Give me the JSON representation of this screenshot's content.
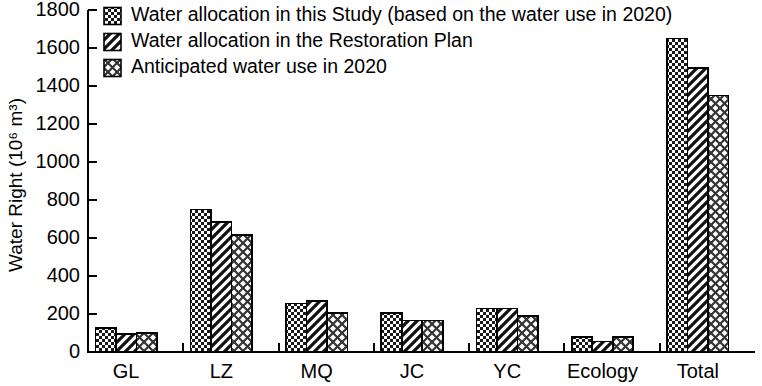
{
  "chart_data": {
    "type": "bar",
    "title": "",
    "xlabel": "",
    "ylabel": "Water Right (10⁶ m³)",
    "ylim": [
      0,
      1800
    ],
    "ytick_labels": [
      "0",
      "200",
      "400",
      "600",
      "800",
      "1000",
      "1200",
      "1400",
      "1600",
      "1800"
    ],
    "ytick_values": [
      0,
      200,
      400,
      600,
      800,
      1000,
      1200,
      1400,
      1600,
      1800
    ],
    "grid": false,
    "legend_position": "top-left",
    "categories": [
      "GL",
      "LZ",
      "MQ",
      "JC",
      "YC",
      "Ecology",
      "Total"
    ],
    "series": [
      {
        "name": "Water allocation in this Study (based on the water use in 2020)",
        "pattern": "dark-checker",
        "values": [
          125,
          750,
          255,
          205,
          228,
          80,
          1650
        ]
      },
      {
        "name": "Water allocation in the Restoration Plan",
        "pattern": "diagonal-hatch",
        "values": [
          95,
          685,
          268,
          165,
          228,
          55,
          1495
        ]
      },
      {
        "name": "Anticipated water use in 2020",
        "pattern": "cross-hatch",
        "values": [
          100,
          615,
          205,
          165,
          190,
          80,
          1350
        ]
      }
    ]
  },
  "legend": {
    "items": [
      {
        "label": "Water allocation in this Study (based on the water use in 2020)"
      },
      {
        "label": "Water allocation in the Restoration Plan"
      },
      {
        "label": "Anticipated water use in 2020"
      }
    ]
  },
  "colors": {
    "axis": "#000000",
    "bar_fill_dark": "#1a1a1a",
    "bar_fill_light": "#ffffff",
    "background": "#ffffff"
  }
}
